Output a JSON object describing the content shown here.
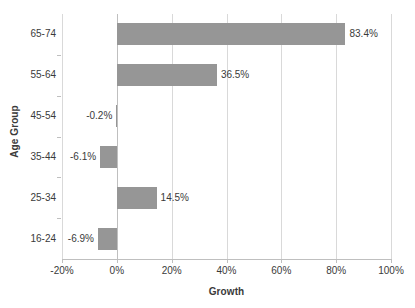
{
  "chart_data": {
    "type": "bar",
    "orientation": "horizontal",
    "title": "",
    "xlabel": "Growth",
    "ylabel": "Age Group",
    "categories": [
      "16-24",
      "25-34",
      "35-44",
      "45-54",
      "55-64",
      "65-74"
    ],
    "values": [
      -6.9,
      14.5,
      -6.1,
      -0.2,
      36.5,
      83.4
    ],
    "data_labels": [
      "-6.9%",
      "14.5%",
      "-6.1%",
      "-0.2%",
      "36.5%",
      "83.4%"
    ],
    "xlim": [
      -20,
      100
    ],
    "x_ticks": [
      -20,
      0,
      20,
      40,
      60,
      80,
      100
    ],
    "x_tick_labels": [
      "-20%",
      "0%",
      "20%",
      "40%",
      "60%",
      "80%",
      "100%"
    ],
    "grid": "vertical",
    "legend": "none",
    "bar_color": "#969696",
    "gridline_color": "#d9d9d9",
    "axis_color": "#bfbfbf",
    "text_color": "#3a3a3a"
  }
}
